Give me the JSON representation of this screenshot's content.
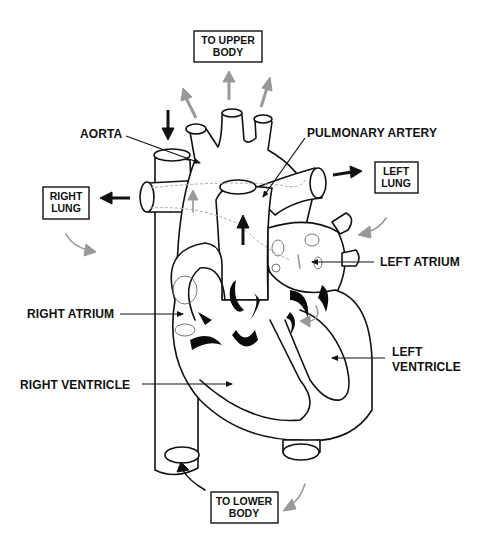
{
  "diagram": {
    "colors": {
      "outline": "#111111",
      "oxygen_poor_arrow": "#111111",
      "oxygen_rich_arrow": "#999999",
      "background": "#ffffff"
    },
    "destination_boxes": {
      "upper_body": {
        "line1": "TO UPPER",
        "line2": "BODY"
      },
      "right_lung": {
        "line1": "RIGHT",
        "line2": "LUNG"
      },
      "left_lung": {
        "line1": "LEFT",
        "line2": "LUNG"
      },
      "lower_body": {
        "line1": "TO LOWER",
        "line2": "BODY"
      }
    },
    "labels": {
      "aorta": "AORTA",
      "pulmonary_artery": "PULMONARY ARTERY",
      "left_atrium": "LEFT ATRIUM",
      "right_atrium": "RIGHT ATRIUM",
      "left_ventricle_line1": "LEFT",
      "left_ventricle_line2": "VENTRICLE",
      "right_ventricle": "RIGHT VENTRICLE"
    },
    "arrow_legend_icons": [
      "arrow-black-icon",
      "arrow-gray-icon"
    ]
  }
}
